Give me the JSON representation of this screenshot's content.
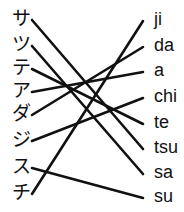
{
  "exercise": {
    "kind": "matching-lines",
    "line_color": "#111111",
    "background_color": "#ffffff"
  },
  "left_column": {
    "name": "katakana-column",
    "items": [
      {
        "label": "サ",
        "y": 18
      },
      {
        "label": "ツ",
        "y": 44
      },
      {
        "label": "テ",
        "y": 67
      },
      {
        "label": "ア",
        "y": 90
      },
      {
        "label": "ダ",
        "y": 113
      },
      {
        "label": "ジ",
        "y": 139
      },
      {
        "label": "ス",
        "y": 166
      },
      {
        "label": "チ",
        "y": 192
      }
    ]
  },
  "right_column": {
    "name": "romaji-column",
    "items": [
      {
        "label": "ji",
        "y": 19
      },
      {
        "label": "da",
        "y": 45
      },
      {
        "label": "a",
        "y": 70
      },
      {
        "label": "chi",
        "y": 96
      },
      {
        "label": "te",
        "y": 122
      },
      {
        "label": "tsu",
        "y": 147
      },
      {
        "label": "sa",
        "y": 172
      },
      {
        "label": "su",
        "y": 196
      }
    ]
  },
  "connections": [
    {
      "name": "line-sa-to-tsu",
      "from": "サ",
      "to": "tsu",
      "x1": 32,
      "y1": 20,
      "x2": 143,
      "y2": 149
    },
    {
      "name": "line-tsu-to-sa",
      "from": "ツ",
      "to": "sa",
      "x1": 32,
      "y1": 46,
      "x2": 143,
      "y2": 174
    },
    {
      "name": "line-te-to-te",
      "from": "テ",
      "to": "te",
      "x1": 32,
      "y1": 69,
      "x2": 143,
      "y2": 124
    },
    {
      "name": "line-a-to-a",
      "from": "ア",
      "to": "a",
      "x1": 32,
      "y1": 92,
      "x2": 143,
      "y2": 72
    },
    {
      "name": "line-da-to-da",
      "from": "ダ",
      "to": "da",
      "x1": 32,
      "y1": 115,
      "x2": 143,
      "y2": 47
    },
    {
      "name": "line-ji-to-chi",
      "from": "ジ",
      "to": "chi",
      "x1": 32,
      "y1": 141,
      "x2": 143,
      "y2": 98
    },
    {
      "name": "line-su-to-su",
      "from": "ス",
      "to": "su",
      "x1": 32,
      "y1": 168,
      "x2": 143,
      "y2": 198
    },
    {
      "name": "line-chi-to-ji",
      "from": "チ",
      "to": "ji",
      "x1": 32,
      "y1": 194,
      "x2": 143,
      "y2": 21
    }
  ]
}
